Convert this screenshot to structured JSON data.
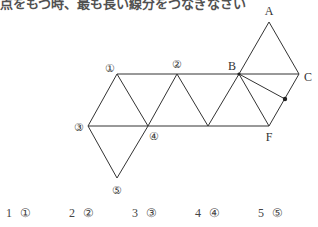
{
  "question": {
    "partial_text": "点をもつ時、最も長い線分をつなぎなさい"
  },
  "figure": {
    "vertices": {
      "A": [
        269,
        22
      ],
      "B": [
        239,
        74
      ],
      "C": [
        299,
        74
      ],
      "F": [
        269,
        126
      ],
      "P": [
        285,
        99
      ],
      "c1": [
        117,
        74
      ],
      "c2": [
        177,
        74
      ],
      "c3": [
        88,
        126
      ],
      "c4": [
        148,
        126
      ],
      "M": [
        208,
        126
      ],
      "c5": [
        117,
        178
      ]
    },
    "labels": {
      "A": "A",
      "B": "B",
      "C": "C",
      "F": "F",
      "c1": "①",
      "c2": "②",
      "c3": "③",
      "c4": "④",
      "c5": "⑤"
    }
  },
  "choices": [
    {
      "num": "1",
      "mark": "①"
    },
    {
      "num": "2",
      "mark": "②"
    },
    {
      "num": "3",
      "mark": "③"
    },
    {
      "num": "4",
      "mark": "④"
    },
    {
      "num": "5",
      "mark": "⑤"
    }
  ]
}
